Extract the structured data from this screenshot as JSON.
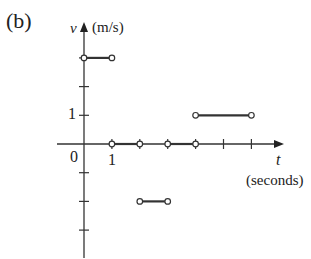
{
  "panel_label": "(b)",
  "chart_data": {
    "type": "line",
    "title": "",
    "xlabel": "t",
    "xunit": "(seconds)",
    "ylabel": "v",
    "yunit": "(m/s)",
    "tick_labels": {
      "x": [
        "0",
        "1"
      ],
      "y": [
        "1"
      ]
    },
    "xlim": [
      0,
      7
    ],
    "ylim": [
      -4,
      4
    ],
    "grid": false,
    "style": "step function with open-circle endpoints",
    "segments": [
      {
        "t_start": 0,
        "t_end": 1,
        "v": 3
      },
      {
        "t_start": 1,
        "t_end": 2,
        "v": 0
      },
      {
        "t_start": 2,
        "t_end": 3,
        "v": -2
      },
      {
        "t_start": 3,
        "t_end": 4,
        "v": 0
      },
      {
        "t_start": 4,
        "t_end": 6,
        "v": 1
      }
    ]
  },
  "labels": {
    "v": "v",
    "v_unit": "(m/s)",
    "t": "t",
    "t_unit": "(seconds)",
    "origin": "0",
    "x_one": "1",
    "y_one": "1"
  }
}
